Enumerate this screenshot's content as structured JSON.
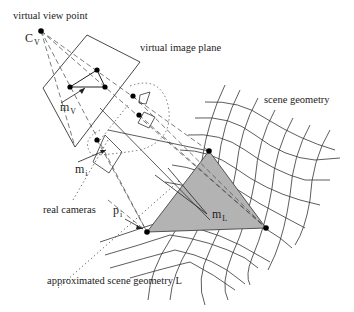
{
  "diagram": {
    "type": "image-based-rendering-geometry",
    "colors": {
      "line": "#333333",
      "triangle_fill": "#b3b3b3",
      "point": "#000000",
      "background": "#ffffff"
    },
    "labels": {
      "virtual_view_point": "virtual view point",
      "cv_main": "C",
      "cv_sub": "V",
      "virtual_image_plane": "virtual image plane",
      "scene_geometry": "scene geometry",
      "mv_main": "m",
      "mv_sub": "V",
      "mi_main": "m",
      "mi_sub": "i",
      "real_cameras": "real cameras",
      "pi_main": "p",
      "pi_sub": "i",
      "ml_main": "m",
      "ml_sub": "L",
      "approximated_scene_geometry": "approximated scene geometry L"
    },
    "nodes": [
      {
        "id": "virtual-view-point",
        "x": 41,
        "y": 31
      },
      {
        "id": "image-point-top",
        "x": 97,
        "y": 70
      },
      {
        "id": "image-point-left",
        "x": 70,
        "y": 87
      },
      {
        "id": "image-point-right",
        "x": 105,
        "y": 87
      },
      {
        "id": "real-camera-1",
        "x": 133,
        "y": 96
      },
      {
        "id": "real-camera-2",
        "x": 139,
        "y": 115
      },
      {
        "id": "real-camera-i",
        "x": 97,
        "y": 140
      },
      {
        "id": "triangle-vertex-top",
        "x": 209,
        "y": 151
      },
      {
        "id": "triangle-vertex-left",
        "x": 147,
        "y": 232
      },
      {
        "id": "triangle-vertex-right",
        "x": 266,
        "y": 228
      }
    ]
  }
}
